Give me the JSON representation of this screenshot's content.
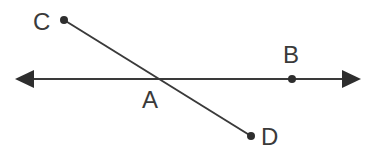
{
  "diagram": {
    "type": "geometry-lines",
    "colors": {
      "stroke": "#3a3a3a",
      "background": "#ffffff"
    },
    "line": {
      "name": "line through A and B",
      "arrows": "both"
    },
    "segment": {
      "name": "segment CD",
      "endpoints": [
        "C",
        "D"
      ]
    },
    "labels": {
      "A": "A",
      "B": "B",
      "C": "C",
      "D": "D"
    },
    "intersection": "A"
  }
}
